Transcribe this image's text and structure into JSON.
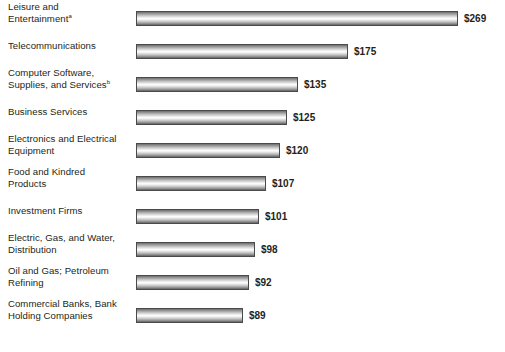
{
  "chart_data": {
    "type": "bar",
    "orientation": "horizontal",
    "title": "",
    "subtitle": "",
    "xlabel": "",
    "ylabel": "",
    "grid": false,
    "legend": null,
    "value_prefix": "$",
    "axis_baseline_value": 82,
    "categories": [
      "Leisure and Entertainment",
      "Telecommunications",
      "Computer Software, Supplies, and Services",
      "Business Services",
      "Electronics and Electrical Equipment",
      "Food and Kindred Products",
      "Investment Firms",
      "Electric, Gas, and Water, Distribution",
      "Oil and Gas; Petroleum Refining",
      "Commercial Banks, Bank Holding Companies"
    ],
    "values": [
      269,
      175,
      135,
      125,
      120,
      107,
      101,
      98,
      92,
      89
    ],
    "value_labels": [
      "$269",
      "$175",
      "$135",
      "$125",
      "$120",
      "$107",
      "$101",
      "$98",
      "$92",
      "$89"
    ],
    "xlim": [
      82,
      284
    ]
  },
  "rows": [
    {
      "label_line1": "Leisure and",
      "label_line2": "Entertainment",
      "footnote_marker": "a",
      "value_label": "$269",
      "value": 269,
      "bar_end_px": 458,
      "top_px": 0,
      "two_line": true
    },
    {
      "label_line1": "Telecommunications",
      "label_line2": "",
      "footnote_marker": "",
      "value_label": "$175",
      "value": 175,
      "bar_end_px": 348,
      "top_px": 33,
      "two_line": false
    },
    {
      "label_line1": "Computer Software,",
      "label_line2": "Supplies, and Services",
      "footnote_marker": "b",
      "value_label": "$135",
      "value": 135,
      "bar_end_px": 298,
      "top_px": 66,
      "two_line": true
    },
    {
      "label_line1": "Business Services",
      "label_line2": "",
      "footnote_marker": "",
      "value_label": "$125",
      "value": 125,
      "bar_end_px": 287,
      "top_px": 99,
      "two_line": false
    },
    {
      "label_line1": "Electronics and Electrical",
      "label_line2": "Equipment",
      "footnote_marker": "",
      "value_label": "$120",
      "value": 120,
      "bar_end_px": 280,
      "top_px": 132,
      "two_line": true
    },
    {
      "label_line1": "Food and Kindred",
      "label_line2": "Products",
      "footnote_marker": "",
      "value_label": "$107",
      "value": 107,
      "bar_end_px": 266,
      "top_px": 165,
      "two_line": true
    },
    {
      "label_line1": "Investment Firms",
      "label_line2": "",
      "footnote_marker": "",
      "value_label": "$101",
      "value": 101,
      "bar_end_px": 259,
      "top_px": 198,
      "two_line": false
    },
    {
      "label_line1": "Electric, Gas, and Water,",
      "label_line2": "Distribution",
      "footnote_marker": "",
      "value_label": "$98",
      "value": 98,
      "bar_end_px": 255,
      "top_px": 231,
      "two_line": true
    },
    {
      "label_line1": "Oil and Gas; Petroleum",
      "label_line2": "Refining",
      "footnote_marker": "",
      "value_label": "$92",
      "value": 92,
      "bar_end_px": 249,
      "top_px": 264,
      "two_line": true
    },
    {
      "label_line1": "Commercial Banks, Bank",
      "label_line2": "Holding Companies",
      "footnote_marker": "",
      "value_label": "$89",
      "value": 89,
      "bar_end_px": 243,
      "top_px": 297,
      "two_line": true
    }
  ],
  "geometry": {
    "bar_left_px": 136,
    "bar_height_px": 15,
    "value_gap_px": 6
  },
  "colors": {
    "background": "#ffffff",
    "text": "#231f20",
    "bar_border": "#4a4a4a",
    "bar_highlight": "#ffffff",
    "bar_shadow": "#5f5f5f"
  }
}
